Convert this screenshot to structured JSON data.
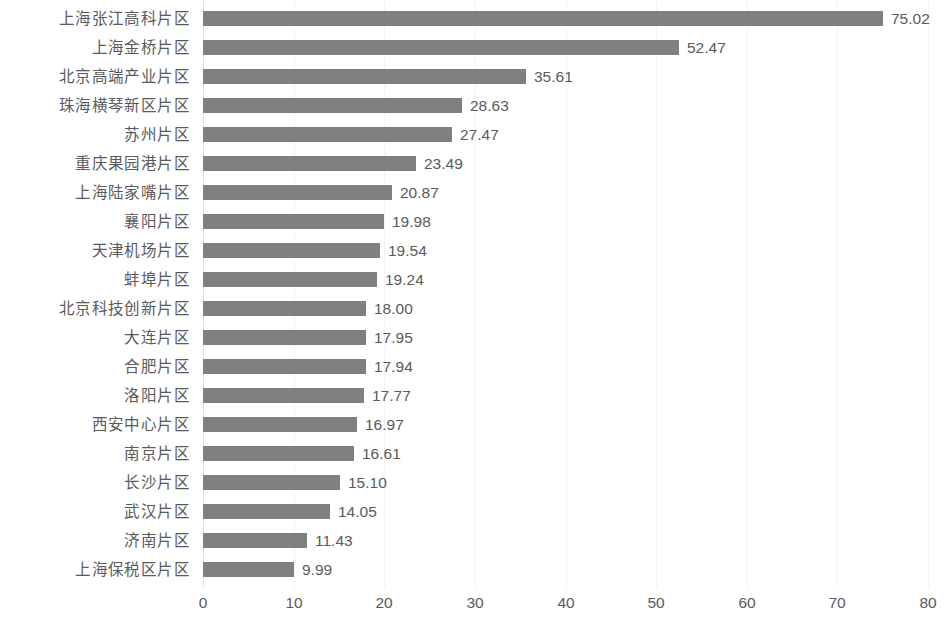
{
  "chart_data": {
    "type": "bar",
    "orientation": "horizontal",
    "title": "",
    "subtitle": "",
    "xlabel": "",
    "ylabel": "",
    "xlim": [
      0,
      80
    ],
    "xticks": [
      0,
      10,
      20,
      30,
      40,
      50,
      60,
      70,
      80
    ],
    "xtick_labels": [
      "0",
      "10",
      "20",
      "30",
      "40",
      "50",
      "60",
      "70",
      "80"
    ],
    "grid": true,
    "grid_axis": "x",
    "legend": false,
    "legend_position": "none",
    "bar_color": "#808080",
    "grid_color": "#f2f2f2",
    "text_color": "#5a5a5a",
    "value_label_format": "0.00",
    "categories": [
      "上海张江高科片区",
      "上海金桥片区",
      "北京高端产业片区",
      "珠海横琴新区片区",
      "苏州片区",
      "重庆果园港片区",
      "上海陆家嘴片区",
      "襄阳片区",
      "天津机场片区",
      "蚌埠片区",
      "北京科技创新片区",
      "大连片区",
      "合肥片区",
      "洛阳片区",
      "西安中心片区",
      "南京片区",
      "长沙片区",
      "武汉片区",
      "济南片区",
      "上海保税区片区"
    ],
    "values": [
      75.02,
      52.47,
      35.61,
      28.63,
      27.47,
      23.49,
      20.87,
      19.98,
      19.54,
      19.24,
      18.0,
      17.95,
      17.94,
      17.77,
      16.97,
      16.61,
      15.1,
      14.05,
      11.43,
      9.99
    ],
    "value_labels": [
      "75.02",
      "52.47",
      "35.61",
      "28.63",
      "27.47",
      "23.49",
      "20.87",
      "19.98",
      "19.54",
      "19.24",
      "18.00",
      "17.95",
      "17.94",
      "17.77",
      "16.97",
      "16.61",
      "15.10",
      "14.05",
      "11.43",
      "9.99"
    ]
  }
}
